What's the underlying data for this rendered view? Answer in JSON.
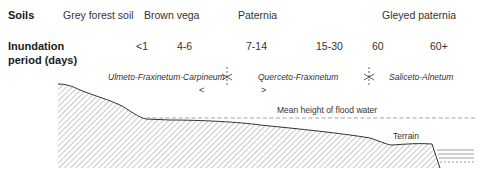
{
  "row_headers": {
    "soils": "Soils",
    "inundation_line1": "Inundation",
    "inundation_line2": "period (days)"
  },
  "soils": [
    {
      "label": "Grey forest soil"
    },
    {
      "label": "Brown vega"
    },
    {
      "label": "Paternia"
    },
    {
      "label": "Gleyed paternia"
    }
  ],
  "inundation_periods": [
    {
      "label": "<1"
    },
    {
      "label": "4-6"
    },
    {
      "label": "7-14"
    },
    {
      "label": "15-30"
    },
    {
      "label": "60"
    },
    {
      "label": "60+"
    }
  ],
  "plant_associations": [
    {
      "label": "Ulmeto-Fraxinetum-Carpineum",
      "arrow": "<"
    },
    {
      "label": "Querceto-Fraxinetum",
      "arrow": ">"
    },
    {
      "label": "Saliceto-Alnetum"
    }
  ],
  "profile_labels": {
    "flood_water": "Mean height of flood water",
    "terrain": "Terrain"
  },
  "colors": {
    "terrain_line": "#333333",
    "hatch": "#9a9a9a",
    "flood_line": "#8a8a8a",
    "water": "#777777"
  }
}
